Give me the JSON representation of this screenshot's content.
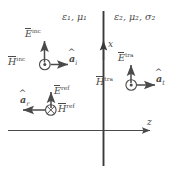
{
  "figure": {
    "background_color": "#ffffff",
    "line_color": "#4a4a4a",
    "interface_color": "#3a3a3a"
  },
  "media": {
    "region1": {
      "label_eps": "ε",
      "sub1": "1",
      "label_mu": "μ",
      "full": "ε₁, μ₁"
    },
    "region2": {
      "full": "ε₂, μ₂, σ₂"
    }
  },
  "axes": {
    "x_label": "x",
    "z_label": "z"
  },
  "waves": {
    "incident": {
      "E_symbol": "E",
      "E_sup": "inc",
      "H_symbol": "H",
      "H_sup": "inc",
      "H_direction_glyph": "out-of-page",
      "unit_vector": "a",
      "unit_vector_sub": "i",
      "propagation": "+z"
    },
    "reflected": {
      "E_symbol": "E",
      "E_sup": "ref",
      "H_symbol": "H",
      "H_sup": "ref",
      "H_direction_glyph": "into-page",
      "unit_vector": "a",
      "unit_vector_sub": "r",
      "propagation": "-z"
    },
    "transmitted": {
      "E_symbol": "E",
      "E_sup": "tra",
      "H_symbol": "H",
      "H_sup": "tra",
      "H_direction_glyph": "out-of-page",
      "unit_vector": "a",
      "unit_vector_sub": "t",
      "propagation": "+z"
    }
  }
}
